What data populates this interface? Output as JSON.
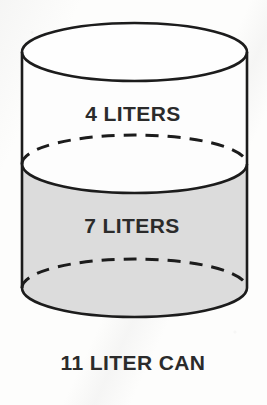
{
  "figure": {
    "title_caption": "11 LITER CAN",
    "upper_label": "4 LITERS",
    "lower_label": "7 LITERS",
    "colors": {
      "background": "#fdfdfc",
      "outline": "#1c1c1c",
      "liquid_fill": "#dcdcdc",
      "empty_fill": "#fdfdfd",
      "text": "#2b2b2b"
    },
    "geometry": {
      "left_wall_x": 22,
      "right_wall_x": 247,
      "top_ellipse_center_y": 52,
      "middle_ellipse_center_y": 164,
      "bottom_ellipse_center_y": 288,
      "ellipse_ry": 29
    },
    "capacity_liters": 11,
    "empty_liters": 4,
    "filled_liters": 7
  }
}
